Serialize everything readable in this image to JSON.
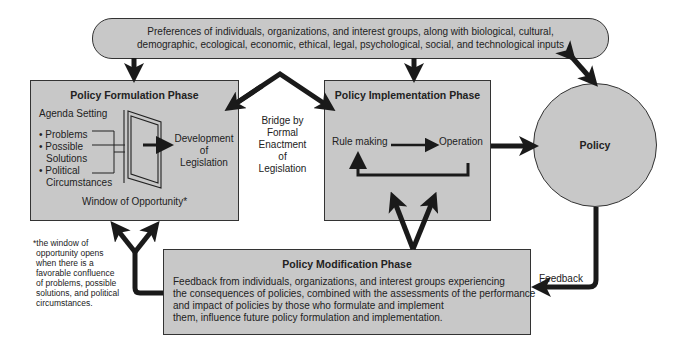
{
  "inputs": {
    "line1": "Preferences of individuals, organizations, and interest groups, along with biological, cultural,",
    "line2": "demographic, ecological, economic, ethical, legal, psychological, social, and technological inputs"
  },
  "formulation": {
    "title": "Policy Formulation Phase",
    "agenda": "Agenda Setting",
    "items": [
      "• Problems",
      "• Possible",
      "Solutions",
      "• Political",
      "Circumstances"
    ],
    "development": [
      "Development",
      "of",
      "Legislation"
    ],
    "window": "Window of Opportunity*"
  },
  "bridge": [
    "Bridge by",
    "Formal",
    "Enactment",
    "of",
    "Legislation"
  ],
  "implementation": {
    "title": "Policy Implementation Phase",
    "rule_making": "Rule making",
    "operation": "Operation"
  },
  "policy": {
    "label": "Policy"
  },
  "footnote": [
    "*the window of",
    "opportunity opens",
    "when there is a",
    "favorable confluence",
    "of problems, possible",
    "solutions, and political",
    "circumstances."
  ],
  "modification": {
    "title": "Policy Modification Phase",
    "lines": [
      "Feedback from individuals, organizations, and interest groups experiencing",
      "the consequences of policies, combined with the assessments of the performance",
      "and impact of policies by those who formulate and implement",
      "them, influence future policy formulation and implementation."
    ]
  },
  "feedback_label": "Feedback",
  "colors": {
    "fill": "#c8c8c8",
    "stroke": "#222222"
  }
}
